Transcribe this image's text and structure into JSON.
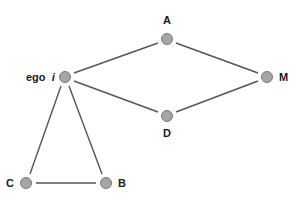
{
  "diagram": {
    "type": "network-graph",
    "colors": {
      "edge": "#555555",
      "node_fill": "#a6a6a6",
      "node_stroke": "#7a7a7a",
      "label": "#1a1a1a",
      "background": "#ffffff"
    },
    "nodes": [
      {
        "id": "ego",
        "label": "ego",
        "label_suffix": "i",
        "x": 65,
        "y": 77
      },
      {
        "id": "A",
        "label": "A",
        "x": 167,
        "y": 39
      },
      {
        "id": "M",
        "label": "M",
        "x": 267,
        "y": 77
      },
      {
        "id": "D",
        "label": "D",
        "x": 167,
        "y": 116
      },
      {
        "id": "C",
        "label": "C",
        "x": 26,
        "y": 183
      },
      {
        "id": "B",
        "label": "B",
        "x": 106,
        "y": 183
      }
    ],
    "edges": [
      {
        "from": "ego",
        "to": "A"
      },
      {
        "from": "A",
        "to": "M"
      },
      {
        "from": "ego",
        "to": "D"
      },
      {
        "from": "D",
        "to": "M"
      },
      {
        "from": "ego",
        "to": "C"
      },
      {
        "from": "ego",
        "to": "B"
      },
      {
        "from": "C",
        "to": "B"
      }
    ]
  }
}
